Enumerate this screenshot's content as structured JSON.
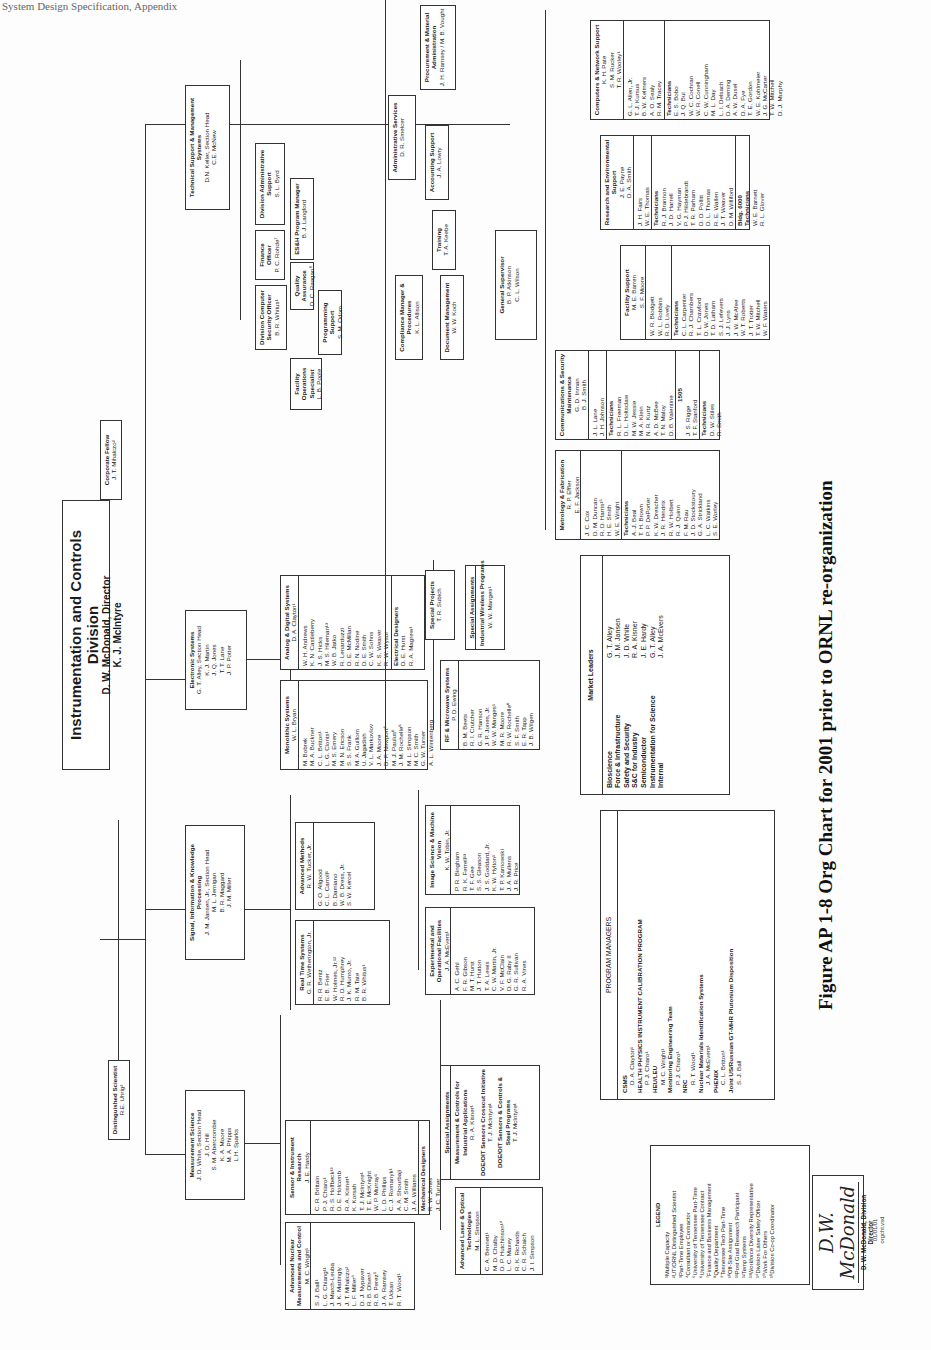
{
  "page_header_fragment": "System Design Specification, Appendix",
  "caption": "Figure AP 1-8 Org Chart for 2001 prior to ORNL re-organization",
  "division": {
    "title": "Instrumentation and Controls Division",
    "director": "D. W. McDonald, Director",
    "deputy": "K. J. McIntyre"
  },
  "distinguished_scientist": {
    "title": "Distinguished Scientist",
    "name": "R.E. Uhrig²"
  },
  "corporate_fellow": {
    "title": "Corporate Fellow",
    "name": "J. T. Mihalczo²"
  },
  "sections": {
    "measurement_science": {
      "title": "Measurement Science",
      "lines": [
        "J. D. White, Section Head",
        "J. D. Hill",
        "S. M. Abercrombie",
        "K. A. Moore",
        "M. A. Phipps",
        "L.H. Sparks"
      ],
      "groups": {
        "advanced_nuclear": {
          "title": "Advanced Nuclear Measurements and Control",
          "leader": "M. C. Wright¹",
          "members": [
            "S. J. Ball¹",
            "L. G. Chiang¹¹",
            "J. March-Leuba",
            "J. K. Mattingly",
            "J. T. Mihalczo²",
            "L. F. Miller⁴",
            "D. J. Nypaver",
            "R. B. Olsen¹",
            "R. B. Perez⁵",
            "J. A. Ramsey",
            "T. Uckan",
            "R. T. Wood¹"
          ]
        },
        "sensor_instrument": {
          "title": "Sensor & Instrument Research",
          "leader": "J. E. Hardy",
          "members": [
            "C. R. Brittain",
            "P. J. Chiaro¹",
            "R. S. Holfbeck¹³",
            "D. E. Holcomb",
            "R. A. Kisner¹",
            "K. Korsah",
            "T. J. McIntyre¹",
            "T. E. McKnight",
            "W. P. Murray¹",
            "L. D. Phillips",
            "C. J. Romanyk¹",
            "A. A. Shourbaji",
            "C. M. Smith",
            "J. A. Williams"
          ],
          "mechanical_designers_label": "Mechanical Designers",
          "mechanical_designers": [
            "R. W. Jones",
            "J. C. Turner"
          ]
        },
        "advanced_laser": {
          "title": "Advanced Laser & Optical Technologies",
          "leader": "M. L. Simpson",
          "members": [
            "C. A. Bennett¹",
            "M. D. Chalby",
            "D. P. Hutchinson¹⁴",
            "L. C. Maxey",
            "R. K. Richards",
            "C. R. Schaich",
            "J. I. Simpson"
          ]
        },
        "special_assignments": {
          "title": "Special Assignments",
          "items": [
            {
              "program": "Measurement & Controls for Industrial Applications",
              "person": "R. A. Kisner¹"
            },
            {
              "program": "DOE/OIT Sensors Crosscut Initiative",
              "person": "T. J. McIntyre¹"
            },
            {
              "program": "DOE/OIT Sensors & Controls & Steel Programs",
              "person": "T. J. McIntyre¹"
            }
          ]
        }
      }
    },
    "signal_information": {
      "title": "Signal, Information & Knowledge Processing",
      "lines": [
        "J. M. Jansen, Jr., Section Head",
        "M. L. Jernigan",
        "B. R. Maggard",
        "J. M. Miller"
      ],
      "groups": {
        "real_time": {
          "title": "Real Time Systems",
          "leader": "G. R. Wetherington, Jr.",
          "members": [
            "R. R. Bentz",
            "E. B. Frier",
            "W. Holmes, Jr.¹²",
            "R. D. Humphrey",
            "J. K. Munro, Jr.",
            "R. M. Tate",
            "B. R. Whitus¹"
          ]
        },
        "advanced_methods": {
          "title": "Advanced Methods",
          "leader": "R. W. Tucker, Jr.",
          "members": [
            "G. O. Allgood",
            "C. L. Carroll¹",
            "B. Damiano",
            "W. B. Dress, Jr.",
            "S. W. Kercel"
          ]
        },
        "experimental": {
          "title": "Experimental and Operational Facilities",
          "leader": "J. A. McEvers¹",
          "members": [
            "A. C. Gehl",
            "F. R. Gibson",
            "M. T. Hurst",
            "J. T. Hutton",
            "T. A. Lewis",
            "C. W. Martin, Jr.",
            "V. F. McClain",
            "D. G. Raby II",
            "G. R. Sullivan",
            "R. A. Vines"
          ]
        },
        "image_science": {
          "title": "Image Science & Machine Vision",
          "leader": "K. W. Tobin, Jr.",
          "members": [
            "P. R. Bingham",
            "R. K. Ferrell¹³",
            "T. F. Gee",
            "S. S. Gleason",
            "J. S. Goddard, Jr.",
            "K. W. Hylton¹",
            "T. P. Karnowski",
            "J. A. Mullens",
            "J. R. Price"
          ]
        }
      }
    },
    "electronic_systems": {
      "title": "Electronic Systems",
      "lines": [
        "G. T. Alley, Section Head",
        "K. J. Martin",
        "J. Q. Jones",
        "T. T. Lane",
        "J. P. Potter"
      ],
      "groups": {
        "monolithic": {
          "title": "Monolithic Systems",
          "leader": "W. L. Bryan",
          "members": [
            "M. Bobrek",
            "M. A. Buckner",
            "C. L. Britton¹",
            "L. G. Clonts¹",
            "M. S. Emery",
            "M. N. Ericson",
            "S. S. Frank",
            "M. A. Guillom",
            "U. Jagadish",
            "V. L. Markovlov",
            "J. A. Moore",
            "D. F. Newport⁶",
            "M. J. Paulus⁶",
            "J. M. Rochelle⁶",
            "M. L. Simpson",
            "M. C. Smith",
            "G. W. Turner",
            "A. L. Wintenberg"
          ]
        },
        "analog_digital": {
          "title": "Analog & Digital Systems",
          "leader": "D. A. Clayton¹",
          "members": [
            "W. H. Andrews",
            "K. N. Castleberry",
            "J. S. Hicks",
            "M. S. Hileman¹³",
            "W. B. Jatko",
            "R. Lenarduzzi",
            "D. E. McMillan",
            "R. N. Nodine",
            "D. E. Smith",
            "C. W. Sohns",
            "K. S. Weaver",
            "R. W. Wysor"
          ],
          "electrical_designers_label": "Electrical Designers",
          "electrical_designers": [
            "D. E. Hurst",
            "R. A. Magrew¹"
          ]
        },
        "rf_microwave": {
          "title": "RF & Microwave Systems",
          "leader": "P. D. Ewing",
          "members": [
            "B. M. Beets",
            "R. I. Crutcher",
            "G. R. Hanson",
            "J. P. Jones, Jr.",
            "W. W. Manges¹",
            "M. R. Moore",
            "R. W. Rochelle⁶",
            "S. F. Smith",
            "E. R. Tapp",
            "J. B. Wilgen"
          ]
        },
        "special_projects": {
          "title": "Special Projects",
          "leader": "T. R. Subich"
        },
        "special_assignments_es": {
          "title": "Special Assignments",
          "program": "Industrial Wireless Programs",
          "person": "W. W. Manges¹"
        }
      }
    },
    "technical_support": {
      "title": "Technical Support & Management Systems",
      "lines": [
        "D.N. Keller, Section Head",
        "C.E. McNew"
      ],
      "units": [
        {
          "title": "Division Administrative Support",
          "name": "S. L. Byrd"
        },
        {
          "title": "ES&H Program Manager",
          "name": "B. J. Langford"
        },
        {
          "title": "Finance Officer",
          "name": "P. C. Rohde⁷"
        },
        {
          "title": "Quality Assurance",
          "name": "D. C. Reagan⁸"
        },
        {
          "title": "Division Computer Security Officer",
          "name": "B. R. Whitus¹"
        },
        {
          "title": "Programming Support",
          "name": "S. M. Odom"
        },
        {
          "title": "Facility Operations Specialist",
          "name": "L. B. Poole"
        },
        {
          "title": "Administrative Services",
          "name": "D. R. Smelcer"
        },
        {
          "title": "Procurement & Material Administration",
          "name": "J. H. Ramsey / M. B. Vought"
        },
        {
          "title": "Accounting Support",
          "name": "J. A. Lowry"
        },
        {
          "title": "Compliance Manager & Procedures",
          "name": "K. L. Allison"
        },
        {
          "title": "Training",
          "name": "T. A. Keebe"
        },
        {
          "title": "Document Management",
          "name": "W. W. Koch"
        }
      ],
      "general_supervisor": {
        "title": "General Supervisor",
        "lines": [
          "B. P. Atkinson",
          "C. L. Wilson"
        ]
      },
      "metrology": {
        "title": "Metrology & Fabrication",
        "lines": [
          "R. P. Effler",
          "E. F. Jackson"
        ],
        "staff": [
          "J. C. Cox",
          "D. M. Duncan",
          "R. D. Harris¹⁵",
          "H. E. Smith",
          "W. E. Wright"
        ],
        "technicians_label": "Technicians",
        "technicians": [
          "A. J. Beal",
          "T. H. Brown",
          "P. P. DePorter",
          "K. W. Drescher",
          "J. R. Hendrix",
          "R. W. Holbert",
          "R. J. Quinn",
          "F. M. Rau",
          "J. D. Stockstoury",
          "G. A. Strickland",
          "L. C. Watkins",
          "S. E. Worley"
        ]
      },
      "communications": {
        "title": "Communications & Security Maintenance",
        "lines": [
          "G. D. Inman",
          "B. J. Smith",
          "J. L. Lane",
          "J. H. Johnson"
        ],
        "technicians_label": "Technicians",
        "technicians": [
          "R. L. Freeman",
          "D. L. Holtsclaw",
          "M. W. Jessie",
          "M. A. Klein",
          "N. R. Kurtz",
          "A. D. McBee",
          "T. N. Maloy",
          "D. B. Valentine"
        ],
        "sub_label": "1505",
        "sub_lines": [
          "J. S. Rigge",
          "T. F. Stanford"
        ],
        "sub_technicians_label": "Technicians",
        "sub_technicians": [
          "D. W. Stiles",
          "R. Smith"
        ]
      },
      "computers_network": {
        "title": "Computers & Network Support",
        "lines": [
          "K. H. Pate",
          "S. M. Rucker",
          "T. R. Wooley¹",
          "G. L. Allen, Jr.",
          "T. J. Kursus",
          "B. W. Kelmers",
          "A. O. Sealy",
          "R. M. Tracey"
        ],
        "technicians_label": "Technicians",
        "technicians": [
          "E. S. Bobo",
          "J. Q. Bui",
          "W. C. Cochran",
          "W. R. Conell",
          "C. W. Cunningham",
          "M. L. Day",
          "L. I. Delsach",
          "D. A. Deming",
          "A. W. Dusel",
          "D. A. Fye",
          "T. E. Gordon",
          "W. E. Kohlmeier",
          "J. G. McCarter",
          "T. W. Mitchell",
          "D. J. Murphy"
        ]
      },
      "research_env": {
        "title": "Research and Environmental Support",
        "lines": [
          "J. E. Payne",
          "D. A. Smith",
          "J. H. Fairs",
          "W. E. Thomas"
        ],
        "technicians_label": "Technicians",
        "technicians": [
          "R. J. Brannon",
          "J. D. Harrell",
          "V. G. Hayman",
          "P. J. Hildebrandt",
          "T. R. Parham",
          "D. D. Pollitt",
          "D. L. Thomas",
          "R. E. Wallen",
          "J. T. Weaver",
          "D. M. Williford"
        ],
        "bldg_label": "Bldg. 6000",
        "bldg_technicians_label": "Technicians",
        "bldg_technicians": [
          "W. E. Barnett",
          "R. L. Glover"
        ]
      },
      "facility_support": {
        "title": "Facility Support",
        "lines": [
          "M. E. Barren",
          "S. F. Moore",
          "W. R. Blodgett",
          "W. L. Robbins",
          "R. D. Lively"
        ],
        "technicians_label": "Technicians",
        "technicians": [
          "C. L. Carpenter",
          "R. J. Chambers",
          "T. L. Crawford",
          "D. W. Jones",
          "T. D. Latham",
          "S. J. Lefevers",
          "J. J. Lyns",
          "J. W. McAfee",
          "W. T. Roberts",
          "J. T. Trotter",
          "T. W. Mitchell",
          "W. F. Waters"
        ]
      }
    }
  },
  "market_leaders": {
    "title": "Market Leaders",
    "rows": [
      {
        "market": "Bioscience",
        "leader": "G. T. Alley"
      },
      {
        "market": "Force & Infrastructure",
        "leader": "J. M. Jansen"
      },
      {
        "market": "Safety and Security",
        "leader": "J. D. White"
      },
      {
        "market": "S&C for Industry",
        "leader": "R. A. Kisner"
      },
      {
        "market": "Semiconductor",
        "leader": "J. E. Hardy"
      },
      {
        "market": "Instrumentation for Science",
        "leader": "G. T. Alley"
      },
      {
        "market": "Internal",
        "leader": "J. A. McEvers"
      }
    ]
  },
  "program_managers": {
    "title": "PROGRAM MANAGERS",
    "entries": [
      {
        "program": "CSMS",
        "person": "D. A. Clayton¹"
      },
      {
        "program": "HEALTH PHYSICS INSTRUMENT CALIBRATION PROGRAM",
        "person": "P. J. Chiaro¹"
      },
      {
        "program": "HEU/LEU",
        "person": "M. C. Wright¹"
      },
      {
        "program": "Monitoring Engineering Team",
        "person": "P. J. Chiaro¹"
      },
      {
        "program": "NRC",
        "person": "R. T. Wood¹"
      },
      {
        "program": "Nuclear Materials Identification Systems",
        "person": "J. A. McEvers¹"
      },
      {
        "program": "PHENIX",
        "person": "C. L. Britton¹"
      },
      {
        "program": "Joint US/Russian GT-MHR Plutonium Disposition",
        "person": "S. J. Ball"
      }
    ]
  },
  "legend": {
    "title": "LEGEND",
    "items": [
      "¹Multiple Capacity",
      "²UT/ORNL Distinguished Scientist",
      "³Part-Time Employee",
      "⁴Consultant or Contractor",
      "⁵University of Tennessee Part-Time",
      "⁶University of Tennessee Contract",
      "⁷Finance and Business Management",
      "⁸Quality Department",
      "⁹Tennessee Tech Part-Time",
      "¹⁰Off-Site Assignment",
      "¹¹Post Grad Research Participant",
      "¹²Temp Systems",
      "¹³Workforce Diversity Representative",
      "¹⁴Division Laser Safety Officer",
      "¹⁵Work For Others",
      "¹⁶Division Co-op Coordinator"
    ]
  },
  "signature": {
    "script": "D.W. McDonald",
    "printed": "D. W. McDonald, Division Director",
    "date": "01/01/01",
    "file": "orgcht.vsd"
  }
}
